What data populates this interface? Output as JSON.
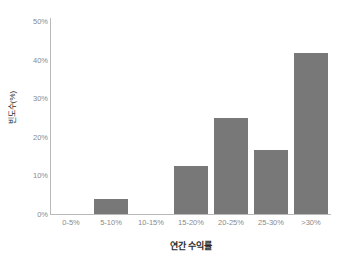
{
  "chart_data": {
    "type": "bar",
    "title": "",
    "xlabel": "연간 수익률",
    "ylabel": "빈도수(%)",
    "categories": [
      "0-5%",
      "5-10%",
      "10-15%",
      "15-20%",
      "20-25%",
      "25-30%",
      ">30%"
    ],
    "values": [
      0,
      3.9,
      0,
      12.4,
      24.9,
      16.6,
      41.6
    ],
    "ylim": [
      0,
      50
    ],
    "ytick_labels": [
      "0%",
      "10%",
      "20%",
      "30%",
      "40%",
      "50%"
    ],
    "ytick_values": [
      0,
      10,
      20,
      30,
      40,
      50
    ],
    "grid": false,
    "legend": null,
    "bar_color": "#787878",
    "axis_color": "#b9b9b9",
    "tick_label_color": "#8a8a8a",
    "title_color": "#2b2b2b",
    "background": "#ffffff"
  }
}
